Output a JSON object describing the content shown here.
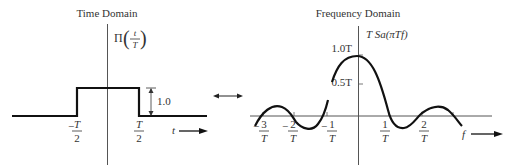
{
  "time_domain": {
    "title": "Time Domain",
    "function_label": {
      "prefix": "Π",
      "num": "t",
      "den": "T"
    },
    "amplitude_label": "1.0",
    "ticks": [
      {
        "sign": "−",
        "num": "T",
        "den": "2"
      },
      {
        "sign": "",
        "num": "T",
        "den": "2"
      }
    ],
    "axis_label": "t"
  },
  "transform_arrow": {
    "symbol": "↔"
  },
  "frequency_domain": {
    "title": "Frequency Domain",
    "function_label": "T Sa(πTf)",
    "y_ticks": [
      "1.0T",
      "0.5T"
    ],
    "x_ticks": [
      {
        "sign": "−",
        "num": "3",
        "den": "T"
      },
      {
        "sign": "−",
        "num": "2",
        "den": "T"
      },
      {
        "sign": "−",
        "num": "1",
        "den": "T"
      },
      {
        "sign": "",
        "num": "1",
        "den": "T"
      },
      {
        "sign": "",
        "num": "2",
        "den": "T"
      }
    ],
    "axis_label": "f"
  }
}
